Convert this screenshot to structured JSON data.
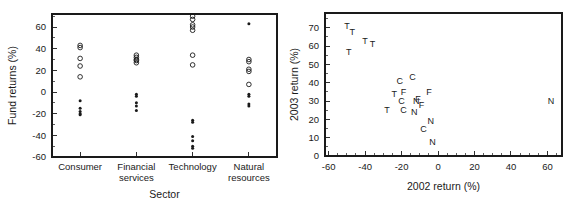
{
  "figure": {
    "background_color": "#ffffff",
    "foreground_color": "#1a1a1a",
    "panel_count": 2
  },
  "chart_data": [
    {
      "id": "fund-returns-by-sector",
      "type": "scatter",
      "title": "",
      "xlabel": "Sector",
      "ylabel": "Fund returns (%)",
      "ylim": [
        -60,
        72
      ],
      "yticks": [
        -60,
        -40,
        -20,
        0,
        20,
        40,
        60
      ],
      "ytick_labels": [
        "-60",
        "-40",
        "-20",
        "0",
        "20",
        "40",
        "60"
      ],
      "categories": [
        "Consumer",
        "Financial services",
        "Technology",
        "Natural resources"
      ],
      "category_tick_labels": [
        [
          "Consumer"
        ],
        [
          "Financial",
          "services"
        ],
        [
          "Technology"
        ],
        [
          "Natural",
          "resources"
        ]
      ],
      "grid": false,
      "legend": "none",
      "marker_styles": {
        "open": "2003 returns (open circles)",
        "filled": "2002 returns (filled circles)"
      },
      "series": [
        {
          "name": "2003 return",
          "marker": "open-circle",
          "points": [
            {
              "category": "Consumer",
              "value": 43
            },
            {
              "category": "Consumer",
              "value": 41
            },
            {
              "category": "Consumer",
              "value": 31
            },
            {
              "category": "Consumer",
              "value": 24
            },
            {
              "category": "Consumer",
              "value": 14
            },
            {
              "category": "Financial services",
              "value": 34
            },
            {
              "category": "Financial services",
              "value": 32
            },
            {
              "category": "Financial services",
              "value": 30
            },
            {
              "category": "Financial services",
              "value": 29
            },
            {
              "category": "Financial services",
              "value": 27
            },
            {
              "category": "Technology",
              "value": 70
            },
            {
              "category": "Technology",
              "value": 67
            },
            {
              "category": "Technology",
              "value": 62
            },
            {
              "category": "Technology",
              "value": 60
            },
            {
              "category": "Technology",
              "value": 57
            },
            {
              "category": "Technology",
              "value": 34
            },
            {
              "category": "Technology",
              "value": 25
            },
            {
              "category": "Natural resources",
              "value": 30
            },
            {
              "category": "Natural resources",
              "value": 28
            },
            {
              "category": "Natural resources",
              "value": 21
            },
            {
              "category": "Natural resources",
              "value": 19
            },
            {
              "category": "Natural resources",
              "value": 7
            }
          ]
        },
        {
          "name": "2002 return",
          "marker": "filled-circle",
          "points": [
            {
              "category": "Consumer",
              "value": -8
            },
            {
              "category": "Consumer",
              "value": -15
            },
            {
              "category": "Consumer",
              "value": -18
            },
            {
              "category": "Consumer",
              "value": -20
            },
            {
              "category": "Consumer",
              "value": -21
            },
            {
              "category": "Financial services",
              "value": -2
            },
            {
              "category": "Financial services",
              "value": -4
            },
            {
              "category": "Financial services",
              "value": -10
            },
            {
              "category": "Financial services",
              "value": -13
            },
            {
              "category": "Financial services",
              "value": -17
            },
            {
              "category": "Technology",
              "value": -26
            },
            {
              "category": "Technology",
              "value": -28
            },
            {
              "category": "Technology",
              "value": -41
            },
            {
              "category": "Technology",
              "value": -45
            },
            {
              "category": "Technology",
              "value": -50
            },
            {
              "category": "Technology",
              "value": -52
            },
            {
              "category": "Natural resources",
              "value": 63
            },
            {
              "category": "Natural resources",
              "value": -2
            },
            {
              "category": "Natural resources",
              "value": -4
            },
            {
              "category": "Natural resources",
              "value": -11
            },
            {
              "category": "Natural resources",
              "value": -13
            }
          ]
        }
      ]
    },
    {
      "id": "return-2003-vs-2002",
      "type": "scatter",
      "title": "",
      "xlabel": "2002 return (%)",
      "ylabel": "2003 return (%)",
      "xlim": [
        -62,
        68
      ],
      "ylim": [
        0,
        78
      ],
      "xticks": [
        -60,
        -40,
        -20,
        0,
        20,
        40,
        60
      ],
      "xtick_labels": [
        "-60",
        "-40",
        "-20",
        "0",
        "20",
        "40",
        "60"
      ],
      "yticks": [
        0,
        10,
        20,
        30,
        40,
        50,
        60,
        70
      ],
      "ytick_labels": [
        "0",
        "10",
        "20",
        "30",
        "40",
        "50",
        "60",
        "70"
      ],
      "grid": false,
      "legend": "none",
      "marker": "letter",
      "letter_key": {
        "C": "Consumer",
        "F": "Financial services",
        "T": "Technology",
        "N": "Natural resources"
      },
      "points": [
        {
          "label": "T",
          "x": -50,
          "y": 71
        },
        {
          "label": "T",
          "x": -47,
          "y": 68
        },
        {
          "label": "T",
          "x": -40,
          "y": 63
        },
        {
          "label": "T",
          "x": -36,
          "y": 61
        },
        {
          "label": "T",
          "x": -49,
          "y": 57
        },
        {
          "label": "C",
          "x": -21,
          "y": 41
        },
        {
          "label": "C",
          "x": -14,
          "y": 43
        },
        {
          "label": "T",
          "x": -24,
          "y": 34
        },
        {
          "label": "F",
          "x": -19,
          "y": 35
        },
        {
          "label": "F",
          "x": -5,
          "y": 35
        },
        {
          "label": "C",
          "x": -20,
          "y": 30
        },
        {
          "label": "N",
          "x": -12,
          "y": 30
        },
        {
          "label": "F",
          "x": -11,
          "y": 31
        },
        {
          "label": "F",
          "x": -9,
          "y": 28
        },
        {
          "label": "T",
          "x": -28,
          "y": 25
        },
        {
          "label": "C",
          "x": -19,
          "y": 25
        },
        {
          "label": "N",
          "x": -13,
          "y": 24
        },
        {
          "label": "N",
          "x": -4,
          "y": 19
        },
        {
          "label": "C",
          "x": -8,
          "y": 15
        },
        {
          "label": "N",
          "x": -3,
          "y": 8
        },
        {
          "label": "N",
          "x": 62,
          "y": 30
        }
      ]
    }
  ]
}
